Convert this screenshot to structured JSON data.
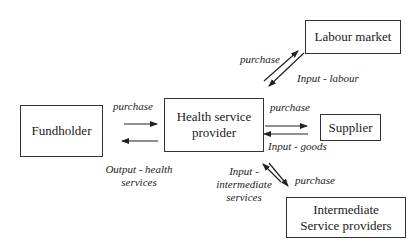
{
  "diagram": {
    "nodes": {
      "fundholder": "Fundholder",
      "provider": "Health service provider",
      "labour": "Labour market",
      "supplier": "Supplier",
      "intermediate": "Intermediate Service providers"
    },
    "edge_labels": {
      "fund_purchase": "purchase",
      "fund_output_1": "Output - health",
      "fund_output_2": "services",
      "labour_purchase": "purchase",
      "labour_input": "Input - labour",
      "supplier_purchase": "purchase",
      "supplier_input": "Input - goods",
      "inter_input_1": "Input -",
      "inter_input_2": "intermediate",
      "inter_input_3": "services",
      "inter_purchase": "purchase"
    }
  }
}
